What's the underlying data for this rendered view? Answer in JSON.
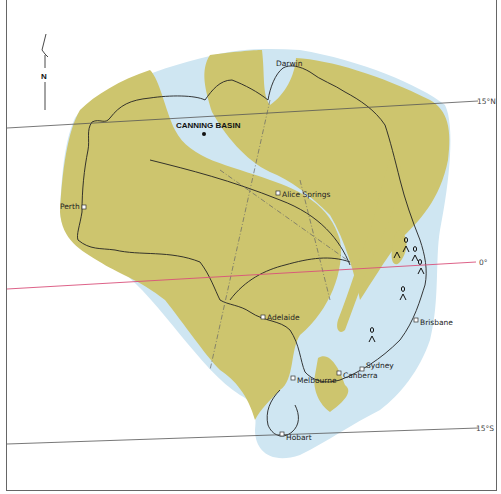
{
  "map": {
    "title": "Australia palaeogeography map",
    "compass": {
      "label": "N"
    },
    "region_label": "CANNING BASIN",
    "cities": [
      {
        "name": "Darwin",
        "x": 300,
        "y": 64
      },
      {
        "name": "Alice Springs",
        "x": 283,
        "y": 195
      },
      {
        "name": "Perth",
        "x": 83,
        "y": 207
      },
      {
        "name": "Adelaide",
        "x": 262,
        "y": 317
      },
      {
        "name": "Brisbane",
        "x": 416,
        "y": 322
      },
      {
        "name": "Sydney",
        "x": 362,
        "y": 369
      },
      {
        "name": "Canberra",
        "x": 339,
        "y": 373
      },
      {
        "name": "Melbourne",
        "x": 293,
        "y": 378
      },
      {
        "name": "Hobart",
        "x": 282,
        "y": 435
      }
    ],
    "latitudes": [
      {
        "label": "15°N",
        "y": 101,
        "color": "#555555"
      },
      {
        "label": "0°",
        "y": 262,
        "color": "#d9507a"
      },
      {
        "label": "15°S",
        "y": 428,
        "color": "#555555"
      }
    ],
    "colors": {
      "land": "#cdc56e",
      "sea": "#cfe6f2",
      "coast": "#222222",
      "equator": "#d9507a",
      "frame": "#666666"
    },
    "legend_symbols": [
      "volcano-symbol"
    ]
  }
}
